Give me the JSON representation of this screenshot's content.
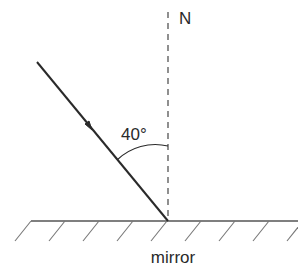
{
  "diagram": {
    "labels": {
      "normal": "N",
      "angle": "40°",
      "surface": "mirror"
    },
    "elements": {
      "incident_ray": {
        "from": [
          37,
          62
        ],
        "to": [
          168,
          221
        ],
        "arrow_direction": "toward mirror"
      },
      "normal_line": {
        "x": 168,
        "y_top": 12,
        "y_bottom": 221,
        "style": "dashed"
      },
      "mirror_line": {
        "y": 221,
        "x_start": 31,
        "x_end": 298
      },
      "angle_of_incidence_deg": 40
    },
    "colors": {
      "ray": "#2a2a2a",
      "normal": "#555555",
      "mirror": "#555555",
      "hatch": "#777777",
      "text": "#2a2a2a"
    }
  }
}
